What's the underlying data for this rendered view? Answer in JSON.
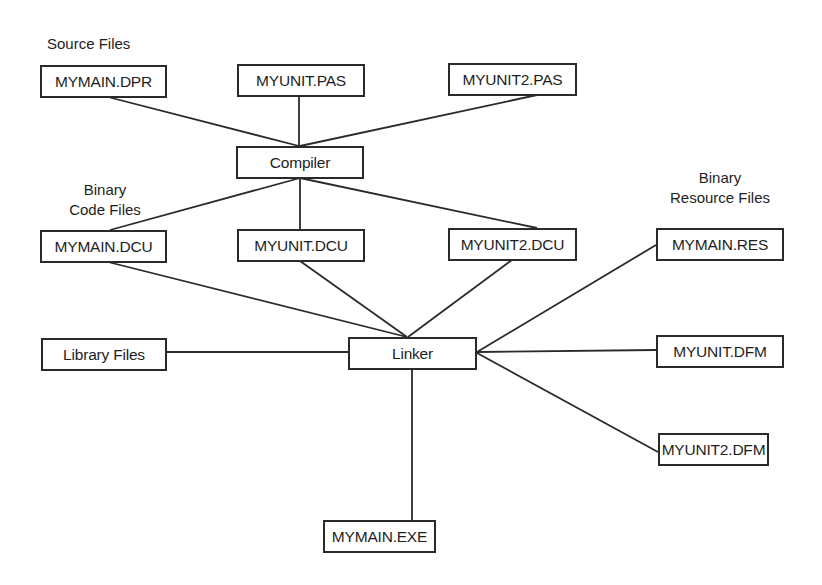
{
  "diagram": {
    "colors": {
      "line": "#2a2a2a",
      "text": "#1e1e1e",
      "background": "#ffffff"
    },
    "group_labels": {
      "source": "Source Files",
      "binary_code_line1": "Binary",
      "binary_code_line2": "Code Files",
      "binary_resource_line1": "Binary",
      "binary_resource_line2": "Resource Files"
    },
    "nodes": {
      "mymain_dpr": "MYMAIN.DPR",
      "myunit_pas": "MYUNIT.PAS",
      "myunit2_pas": "MYUNIT2.PAS",
      "compiler": "Compiler",
      "mymain_dcu": "MYMAIN.DCU",
      "myunit_dcu": "MYUNIT.DCU",
      "myunit2_dcu": "MYUNIT2.DCU",
      "library_files": "Library Files",
      "linker": "Linker",
      "mymain_res": "MYMAIN.RES",
      "myunit_dfm": "MYUNIT.DFM",
      "myunit2_dfm": "MYUNIT2.DFM",
      "mymain_exe": "MYMAIN.EXE"
    },
    "edges": [
      [
        "MYMAIN.DPR",
        "Compiler"
      ],
      [
        "MYUNIT.PAS",
        "Compiler"
      ],
      [
        "MYUNIT2.PAS",
        "Compiler"
      ],
      [
        "Compiler",
        "MYMAIN.DCU"
      ],
      [
        "Compiler",
        "MYUNIT.DCU"
      ],
      [
        "Compiler",
        "MYUNIT2.DCU"
      ],
      [
        "MYMAIN.DCU",
        "Linker"
      ],
      [
        "MYUNIT.DCU",
        "Linker"
      ],
      [
        "MYUNIT2.DCU",
        "Linker"
      ],
      [
        "Library Files",
        "Linker"
      ],
      [
        "MYMAIN.RES",
        "Linker"
      ],
      [
        "MYUNIT.DFM",
        "Linker"
      ],
      [
        "MYUNIT2.DFM",
        "Linker"
      ],
      [
        "Linker",
        "MYMAIN.EXE"
      ]
    ]
  }
}
